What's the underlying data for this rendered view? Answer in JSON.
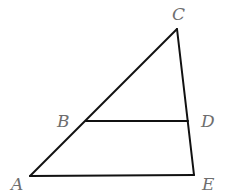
{
  "diagram": {
    "type": "geometry",
    "stroke_color": "#111111",
    "label_color": "#6e6e6e",
    "points": {
      "A": {
        "label": "A",
        "x": 30,
        "y": 176,
        "label_x": 11,
        "label_y": 190
      },
      "B": {
        "label": "B",
        "x": 86,
        "y": 121,
        "label_x": 57,
        "label_y": 127
      },
      "C": {
        "label": "C",
        "x": 177,
        "y": 29,
        "label_x": 172,
        "label_y": 20
      },
      "D": {
        "label": "D",
        "x": 188,
        "y": 121,
        "label_x": 201,
        "label_y": 127
      },
      "E": {
        "label": "E",
        "x": 194,
        "y": 175,
        "label_x": 202,
        "label_y": 190
      }
    },
    "segments": [
      {
        "name": "AC",
        "from": "A",
        "to": "C"
      },
      {
        "name": "CE",
        "from": "C",
        "to": "E"
      },
      {
        "name": "AE",
        "from": "A",
        "to": "E"
      },
      {
        "name": "BD",
        "from": "B",
        "to": "D"
      }
    ]
  }
}
